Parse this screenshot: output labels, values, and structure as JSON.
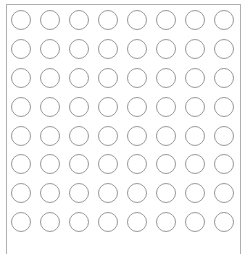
{
  "grid": {
    "rows": 8,
    "cols": 8,
    "col_centers": [
      21,
      50,
      79,
      108,
      137,
      166,
      195,
      224
    ],
    "row_centers": [
      20,
      49,
      78,
      107,
      136,
      164,
      193,
      222
    ],
    "radius": 9.5,
    "stroke_color": "#9a9a9a",
    "fill_color": "#ffffff",
    "stroke_width": 1
  },
  "frame": {
    "border_color": "#b0b0b0"
  }
}
